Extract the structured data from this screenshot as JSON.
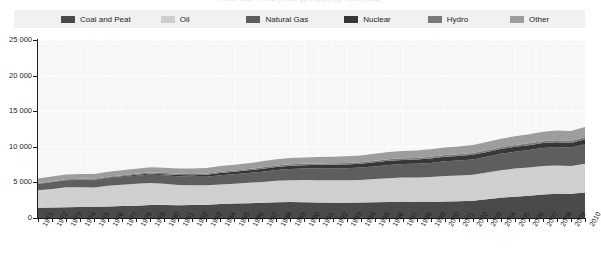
{
  "title": "World Total Primary Energy Supply by Fuel (Mtoe)",
  "legend": {
    "background": "#f1f1f1",
    "items": [
      {
        "label": "Coal and Peat",
        "color": "#4a4a4a"
      },
      {
        "label": "Oil",
        "color": "#cfcfcf"
      },
      {
        "label": "Natural Gas",
        "color": "#5e5e5e"
      },
      {
        "label": "Nuclear",
        "color": "#373737"
      },
      {
        "label": "Hydro",
        "color": "#7a7a7a"
      },
      {
        "label": "Other",
        "color": "#9d9d9d"
      }
    ]
  },
  "axes": {
    "y_ticks": [
      "25 000",
      "20 000",
      "15 000",
      "10 000",
      "5 000",
      "0"
    ],
    "y_tick_values": [
      25000,
      20000,
      15000,
      10000,
      5000,
      0
    ],
    "ymin": 0,
    "ymax": 25000,
    "x_labels": [
      "1971",
      "1972",
      "1973",
      "1974",
      "1975",
      "1976",
      "1977",
      "1978",
      "1979",
      "1980",
      "1981",
      "1982",
      "1983",
      "1984",
      "1985",
      "1986",
      "1987",
      "1988",
      "1989",
      "1990",
      "1991",
      "1992",
      "1993",
      "1994",
      "1995",
      "1996",
      "1997",
      "1998",
      "1999",
      "2000",
      "2001",
      "2002",
      "2003",
      "2004",
      "2005",
      "2006",
      "2007",
      "2008",
      "2009",
      "2010"
    ]
  },
  "chart_data": {
    "type": "area",
    "title": "World Total Primary Energy Supply by Fuel (Mtoe)",
    "xlabel": "",
    "ylabel": "",
    "ylim": [
      0,
      25000
    ],
    "grid": true,
    "legend_position": "top",
    "stacked": true,
    "x": [
      1971,
      1972,
      1973,
      1974,
      1975,
      1976,
      1977,
      1978,
      1979,
      1980,
      1981,
      1982,
      1983,
      1984,
      1985,
      1986,
      1987,
      1988,
      1989,
      1990,
      1991,
      1992,
      1993,
      1994,
      1995,
      1996,
      1997,
      1998,
      1999,
      2000,
      2001,
      2002,
      2003,
      2004,
      2005,
      2006,
      2007,
      2008,
      2009,
      2010
    ],
    "series": [
      {
        "name": "Coal and Peat",
        "color": "#4a4a4a",
        "values": [
          1440,
          1470,
          1500,
          1530,
          1570,
          1630,
          1690,
          1730,
          1810,
          1820,
          1800,
          1830,
          1870,
          1960,
          2030,
          2070,
          2130,
          2200,
          2230,
          2220,
          2180,
          2150,
          2150,
          2160,
          2220,
          2260,
          2280,
          2250,
          2240,
          2310,
          2350,
          2420,
          2650,
          2830,
          2990,
          3140,
          3300,
          3400,
          3400,
          3570
        ]
      },
      {
        "name": "Oil",
        "color": "#cfcfcf",
        "values": [
          2450,
          2620,
          2810,
          2790,
          2720,
          2900,
          2980,
          3080,
          3120,
          2980,
          2850,
          2760,
          2720,
          2760,
          2770,
          2870,
          2930,
          3030,
          3080,
          3100,
          3120,
          3150,
          3140,
          3190,
          3250,
          3320,
          3420,
          3440,
          3510,
          3580,
          3610,
          3640,
          3730,
          3880,
          3950,
          3970,
          4010,
          3980,
          3920,
          4060
        ]
      },
      {
        "name": "Natural Gas",
        "color": "#5e5e5e",
        "values": [
          890,
          940,
          980,
          1000,
          1000,
          1050,
          1080,
          1120,
          1180,
          1190,
          1200,
          1210,
          1220,
          1300,
          1340,
          1370,
          1450,
          1500,
          1570,
          1620,
          1670,
          1680,
          1710,
          1730,
          1780,
          1870,
          1880,
          1920,
          1980,
          2070,
          2100,
          2170,
          2230,
          2300,
          2370,
          2430,
          2530,
          2590,
          2540,
          2720
        ]
      },
      {
        "name": "Nuclear",
        "color": "#373737",
        "values": [
          29,
          40,
          53,
          63,
          84,
          100,
          124,
          145,
          148,
          166,
          201,
          214,
          250,
          307,
          355,
          383,
          420,
          449,
          468,
          476,
          492,
          503,
          523,
          545,
          574,
          586,
          582,
          598,
          628,
          646,
          655,
          664,
          658,
          676,
          687,
          686,
          682,
          684,
          687,
          720
        ]
      },
      {
        "name": "Hydro",
        "color": "#7a7a7a",
        "values": [
          104,
          108,
          111,
          120,
          124,
          125,
          130,
          137,
          143,
          148,
          152,
          158,
          164,
          171,
          174,
          178,
          181,
          186,
          188,
          187,
          192,
          194,
          201,
          205,
          214,
          221,
          222,
          223,
          227,
          228,
          228,
          229,
          233,
          243,
          251,
          261,
          266,
          276,
          281,
          295
        ]
      },
      {
        "name": "Other",
        "color": "#9d9d9d",
        "values": [
          640,
          650,
          660,
          670,
          680,
          690,
          700,
          715,
          725,
          740,
          755,
          770,
          785,
          800,
          820,
          835,
          850,
          870,
          885,
          900,
          915,
          930,
          945,
          965,
          985,
          1005,
          1020,
          1040,
          1060,
          1085,
          1105,
          1130,
          1160,
          1195,
          1230,
          1270,
          1310,
          1350,
          1380,
          1430
        ]
      }
    ]
  }
}
